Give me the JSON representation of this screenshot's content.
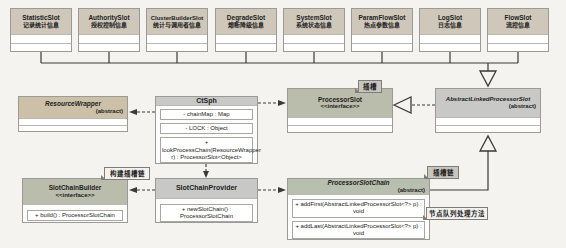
{
  "diagram": {
    "title_semantic": "Sentinel slot-chain UML class diagram",
    "slots": [
      {
        "name": "StatisticSlot",
        "desc": "记录统计信息"
      },
      {
        "name": "AuthoritySlot",
        "desc": "授权控制信息"
      },
      {
        "name": "ClusterBuilderSlot",
        "desc": "统计与调用者信息"
      },
      {
        "name": "DegradeSlot",
        "desc": "熔断降级信息"
      },
      {
        "name": "SystemSlot",
        "desc": "系统状态信息"
      },
      {
        "name": "ParamFlowSlot",
        "desc": "热点参数信息"
      },
      {
        "name": "LogSlot",
        "desc": "日志信息"
      },
      {
        "name": "FlowSlot",
        "desc": "流控信息"
      }
    ],
    "classes": {
      "resource_wrapper": {
        "name": "ResourceWrapper",
        "stereotype": "(abstract)"
      },
      "ctsph": {
        "name": "CtSph",
        "fields": [
          "- chainMap : Map",
          "- LOCK : Object"
        ],
        "methods": [
          "+ lookProcessChain(ResourceWrapper r) : ProcessorSlot<Object>"
        ]
      },
      "processor_slot": {
        "name": "ProcessorSlot",
        "stereotype": "<<interface>>"
      },
      "abstract_linked_processor_slot": {
        "name": "AbstractLinkedProcessorSlot",
        "stereotype": "(abstract)"
      },
      "slot_chain_builder": {
        "name": "SlotChainBuilder",
        "stereotype": "<<interface>>",
        "methods": [
          "+ build() : ProcessorSlotChain"
        ]
      },
      "slot_chain_provider": {
        "name": "SlotChainProvider",
        "methods": [
          "+ newSlotChain() : ProcessorSlotChain"
        ]
      },
      "processor_slot_chain": {
        "name": "ProcessorSlotChain",
        "stereotype": "(abstract)",
        "methods": [
          "+ addFirst(AbstractLinkedProcessorSlot<?> p) : void",
          "+ addLast(AbstractLinkedProcessorSlot<?> p) : void"
        ]
      }
    },
    "notes": {
      "slot": "插槽",
      "build_chain": "构建插槽链",
      "slot_chain": "插槽链",
      "node_method": "节点队列处理方法"
    },
    "colors": {
      "slot_header": "#cfc8ba",
      "tan_header": "#cdc0a8",
      "gray_header": "#c8c8c6",
      "green_header": "#babdab",
      "background": "#f4f3f0",
      "line": "#3a3a3a"
    }
  }
}
